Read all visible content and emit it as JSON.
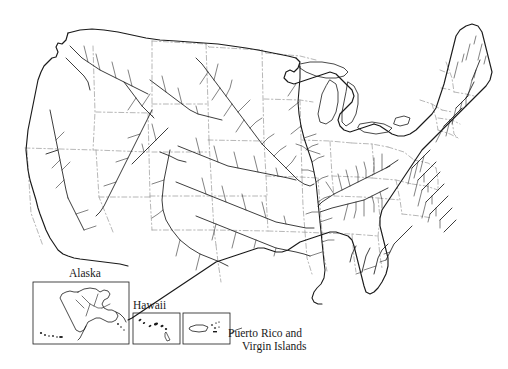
{
  "map": {
    "kind": "line-map",
    "region": "United States",
    "subject": "major rivers and state boundaries",
    "background_color": "#ffffff",
    "line_color": "#1a1a1a",
    "boundary_color": "#8a8a8a",
    "title": "",
    "insets": [
      {
        "id": "alaska",
        "label": "Alaska",
        "label_position": "above",
        "box": {
          "x": 33,
          "y": 282,
          "w": 96,
          "h": 62
        }
      },
      {
        "id": "hawaii",
        "label": "Hawaii",
        "label_position": "above",
        "box": {
          "x": 133,
          "y": 313,
          "w": 47,
          "h": 31
        }
      },
      {
        "id": "puerto_rico",
        "label_line_1": "Puerto Rico and",
        "label_line_2": "Virgin Islands",
        "label_position": "right-leader",
        "box": {
          "x": 183,
          "y": 313,
          "w": 47,
          "h": 31
        }
      }
    ]
  },
  "labels": {
    "alaska": "Alaska",
    "hawaii": "Hawaii",
    "puerto_rico_line1": "Puerto Rico and",
    "puerto_rico_line2": "Virgin Islands"
  }
}
